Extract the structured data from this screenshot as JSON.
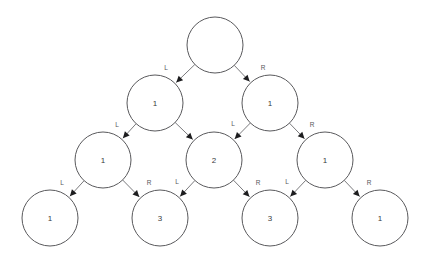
{
  "diagram": {
    "type": "binary-recursion-tree",
    "node_radius": 28,
    "colors": {
      "node_stroke": "#59595c",
      "node_fill": "#ffffff",
      "edge": "#6b6b6e",
      "arrow": "#1d1d1f",
      "label_text": "#3a3a3c",
      "edge_label_text": "#57575a",
      "background": "#ffffff"
    },
    "levels": [
      {
        "index": 0,
        "y": 45,
        "nodes": [
          {
            "id": "n0",
            "x": 215,
            "label": ""
          }
        ]
      },
      {
        "index": 1,
        "y": 103,
        "nodes": [
          {
            "id": "n1",
            "x": 155,
            "label": "1"
          },
          {
            "id": "n2",
            "x": 270,
            "label": "1"
          }
        ]
      },
      {
        "index": 2,
        "y": 160,
        "nodes": [
          {
            "id": "n3",
            "x": 103,
            "label": "1"
          },
          {
            "id": "n4",
            "x": 214,
            "label": "2"
          },
          {
            "id": "n5",
            "x": 325,
            "label": "1"
          }
        ]
      },
      {
        "index": 3,
        "y": 218,
        "nodes": [
          {
            "id": "n6",
            "x": 50,
            "label": "1"
          },
          {
            "id": "n7",
            "x": 160,
            "label": "3"
          },
          {
            "id": "n8",
            "x": 270,
            "label": "3"
          },
          {
            "id": "n9",
            "x": 380,
            "label": "1"
          }
        ]
      }
    ],
    "edges": [
      {
        "id": "e0",
        "from": "n0",
        "to": "n1",
        "label": "L",
        "label_x": 166,
        "label_y": 68
      },
      {
        "id": "e1",
        "from": "n0",
        "to": "n2",
        "label": "R",
        "label_x": 263,
        "label_y": 68
      },
      {
        "id": "e2",
        "from": "n1",
        "to": "n3",
        "label": "L",
        "label_x": 117,
        "label_y": 125
      },
      {
        "id": "e3",
        "from": "n1",
        "to": "n4",
        "label": "",
        "label_x": 0,
        "label_y": 0
      },
      {
        "id": "e4",
        "from": "n2",
        "to": "n4",
        "label": "L",
        "label_x": 233,
        "label_y": 124
      },
      {
        "id": "e5",
        "from": "n2",
        "to": "n5",
        "label": "R",
        "label_x": 312,
        "label_y": 125
      },
      {
        "id": "e6",
        "from": "n3",
        "to": "n6",
        "label": "L",
        "label_x": 62,
        "label_y": 183
      },
      {
        "id": "e7",
        "from": "n3",
        "to": "n7",
        "label": "R",
        "label_x": 149,
        "label_y": 183
      },
      {
        "id": "e8",
        "from": "n4",
        "to": "n7",
        "label": "L",
        "label_x": 177,
        "label_y": 182
      },
      {
        "id": "e9",
        "from": "n4",
        "to": "n8",
        "label": "R",
        "label_x": 258,
        "label_y": 183
      },
      {
        "id": "e10",
        "from": "n5",
        "to": "n8",
        "label": "L",
        "label_x": 287,
        "label_y": 182
      },
      {
        "id": "e11",
        "from": "n5",
        "to": "n9",
        "label": "R",
        "label_x": 369,
        "label_y": 183
      }
    ]
  }
}
